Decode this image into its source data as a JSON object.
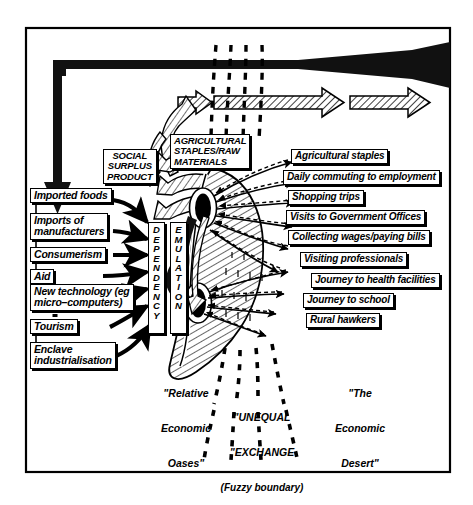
{
  "figure": {
    "kind": "schematic-flow-diagram",
    "frame_color": "#000000",
    "background": "#ffffff"
  },
  "chart_data": {
    "type": "diagram",
    "title": "",
    "regions": [
      {
        "name": "relative-economic-oases",
        "label": "\"Relative\nEconomic\nOases\""
      },
      {
        "name": "unequal-exchange-boundary",
        "label": "\"UNEQUAL\nEXCHANGE\n(Fuzzy boundary)"
      },
      {
        "name": "the-economic-desert",
        "label": "\"The\nEconomic\nDesert\""
      }
    ],
    "inputs_left": [
      "Imported foods",
      "Imports of\nmanufacturers",
      "Consumerism",
      "Aid",
      "New technology (eg\nmicro-computers)",
      "Tourism",
      "Enclave\nindustrialisation"
    ],
    "core_columns": [
      "DEPENDENCY",
      "EMULATION"
    ],
    "extracted_flows": [
      "SOCIAL\nSURPLUS\nPRODUCT",
      "AGRICULTURAL\nSTAPLES/RAW\nMATERIALS"
    ],
    "outputs_right": [
      "Agricultural staples",
      "Daily commuting to employment",
      "Shopping trips",
      "Visits to Government Offices",
      "Collecting wages/paying bills",
      "Visiting professionals",
      "Journey to health facilities",
      "Journey to school",
      "Rural hawkers"
    ]
  },
  "inputs": {
    "imported_foods": "Imported foods",
    "imports_of_manufacturers_1": "Imports of",
    "imports_of_manufacturers_2": "manufacturers",
    "consumerism": "Consumerism",
    "aid": "Aid",
    "new_technology_1": "New technology (eg",
    "new_technology_2": "micro–computers)",
    "tourism": "Tourism",
    "enclave_1": "Enclave",
    "enclave_2": "industrialisation"
  },
  "flows": {
    "social_surplus_1": "SOCIAL",
    "social_surplus_2": "SURPLUS",
    "social_surplus_3": "PRODUCT",
    "agri_raw_1": "AGRICULTURAL",
    "agri_raw_2": "STAPLES/RAW",
    "agri_raw_3": "MATERIALS"
  },
  "columns": {
    "dependency": "DEPENDENCY",
    "emulation": "EMULATION"
  },
  "outputs": {
    "agricultural_staples": "Agricultural staples",
    "daily_commuting": "Daily commuting to employment",
    "shopping_trips": "Shopping trips",
    "visits_government": "Visits to Government Offices",
    "collecting_wages": "Collecting wages/paying bills",
    "visiting_professionals": "Visiting professionals",
    "journey_health": "Journey to health facilities",
    "journey_school": "Journey to school",
    "rural_hawkers": "Rural hawkers"
  },
  "captions": {
    "oases_1": "\"Relative",
    "oases_2": "Economic",
    "oases_3": "Oases\"",
    "unequal_1": "\"UNEQUAL",
    "unequal_2": "\"EXCHANGE",
    "unequal_3": "(Fuzzy boundary)",
    "desert_1": "\"The",
    "desert_2": "Economic",
    "desert_3": "Desert\""
  }
}
